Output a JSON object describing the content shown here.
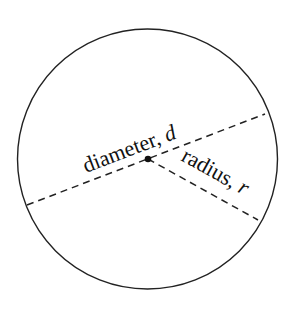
{
  "diagram": {
    "circle": {
      "cx": 147.5,
      "cy": 159,
      "r": 131,
      "stroke": "#222222"
    },
    "center_point": {
      "x": 148,
      "y": 159
    },
    "diameter": {
      "label_word": "diameter, ",
      "label_symbol": "d",
      "x1": 27,
      "y1": 205,
      "x2": 265,
      "y2": 114
    },
    "radius": {
      "label_word": "radius, ",
      "label_symbol": "r",
      "x1": 148,
      "y1": 159,
      "x2": 258,
      "y2": 220
    }
  }
}
